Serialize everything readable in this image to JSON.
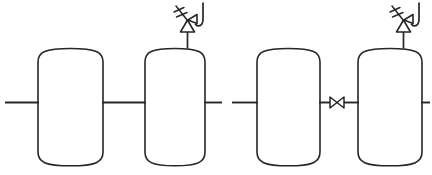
{
  "diagram": {
    "title": "Process Vessel Train Diagram",
    "type": "piping-and-instrumentation-schematic",
    "style": "hand-drawn line art",
    "canvas": {
      "width": 432,
      "height": 175
    },
    "colors": {
      "background": "#ffffff",
      "line": "#262626",
      "fill": "#ffffff"
    },
    "vessels": [
      {
        "id": "vessel-1",
        "label": "",
        "x": 38,
        "y": 48,
        "width": 65,
        "height": 118,
        "head_type": "dished",
        "has_relief_valve": false
      },
      {
        "id": "vessel-2",
        "label": "",
        "x": 145,
        "y": 48,
        "width": 60,
        "height": 118,
        "head_type": "dished",
        "has_relief_valve": true
      },
      {
        "id": "vessel-3",
        "label": "",
        "x": 257,
        "y": 48,
        "width": 63,
        "height": 118,
        "head_type": "dished",
        "has_relief_valve": false
      },
      {
        "id": "vessel-4",
        "label": "",
        "x": 358,
        "y": 48,
        "width": 64,
        "height": 118,
        "head_type": "dished",
        "has_relief_valve": true
      }
    ],
    "pipe_line_y": 102,
    "pipe_segments": [
      {
        "id": "inlet-pipe",
        "x1": 5,
        "x2": 38,
        "y": 102
      },
      {
        "id": "pipe-vessel1-to-vessel2",
        "x1": 103,
        "x2": 145,
        "y": 102
      },
      {
        "id": "pipe-vessel2-outlet-stub",
        "x1": 205,
        "x2": 222,
        "y": 102
      },
      {
        "id": "pipe-vessel3-inlet-stub",
        "x1": 232,
        "x2": 257,
        "y": 102
      },
      {
        "id": "pipe-vessel3-to-valve",
        "x1": 320,
        "x2": 330,
        "y": 102
      },
      {
        "id": "pipe-valve-to-vessel4",
        "x1": 344,
        "x2": 358,
        "y": 102
      },
      {
        "id": "outlet-pipe",
        "x1": 422,
        "x2": 430,
        "y": 102
      }
    ],
    "inline_valve": {
      "id": "check-valve",
      "symbol": "bowtie",
      "label": "",
      "center_x": 337,
      "center_y": 102,
      "half_width": 7,
      "half_height": 5.5
    },
    "relief_valves": [
      {
        "id": "relief-valve-vessel-2",
        "label": "",
        "symbol": "pressure-relief-valve",
        "stem_x": 187,
        "vessel_top_y": 48,
        "triangle_base_y": 31,
        "triangle_apex_y": 20,
        "triangle_half_width": 7,
        "spring_angle_deg": 40,
        "discharge_direction": "right-j-hook"
      },
      {
        "id": "relief-valve-vessel-4",
        "label": "",
        "symbol": "pressure-relief-valve",
        "stem_x": 403,
        "vessel_top_y": 48,
        "triangle_base_y": 31,
        "triangle_apex_y": 20,
        "triangle_half_width": 7,
        "spring_angle_deg": 40,
        "discharge_direction": "right-j-hook"
      }
    ]
  }
}
